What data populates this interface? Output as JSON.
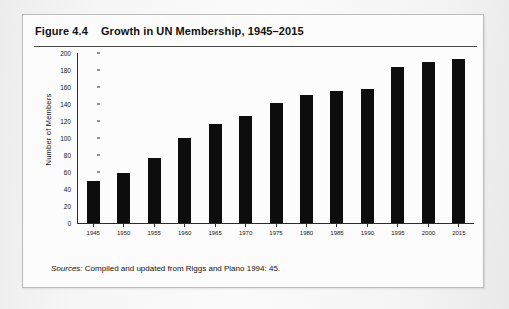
{
  "figure": {
    "number": "Figure 4.4",
    "title": "Growth in UN Membership, 1945–2015",
    "source_lead": "Sources:",
    "source_text": "Compiled and updated from Riggs and Plano 1994: 45."
  },
  "chart_data": {
    "type": "bar",
    "title": "Growth in UN Membership, 1945–2015",
    "xlabel": "",
    "ylabel": "Number of Members",
    "categories": [
      "1945",
      "1950",
      "1955",
      "1960",
      "1965",
      "1970",
      "1975",
      "1980",
      "1985",
      "1990",
      "1995",
      "2000",
      "2015"
    ],
    "values": [
      50,
      59,
      76,
      100,
      117,
      126,
      141,
      151,
      155,
      158,
      184,
      189,
      193
    ],
    "ylim": [
      0,
      200
    ],
    "ytick_values": [
      0,
      20,
      40,
      60,
      80,
      100,
      120,
      140,
      160,
      180,
      200
    ],
    "ytick_labels": [
      "0",
      "20",
      "40",
      "60",
      "80",
      "100",
      "120",
      "140",
      "160",
      "180",
      "200"
    ],
    "grid": false,
    "legend": "none",
    "bar_color": "#0d0d0d"
  }
}
